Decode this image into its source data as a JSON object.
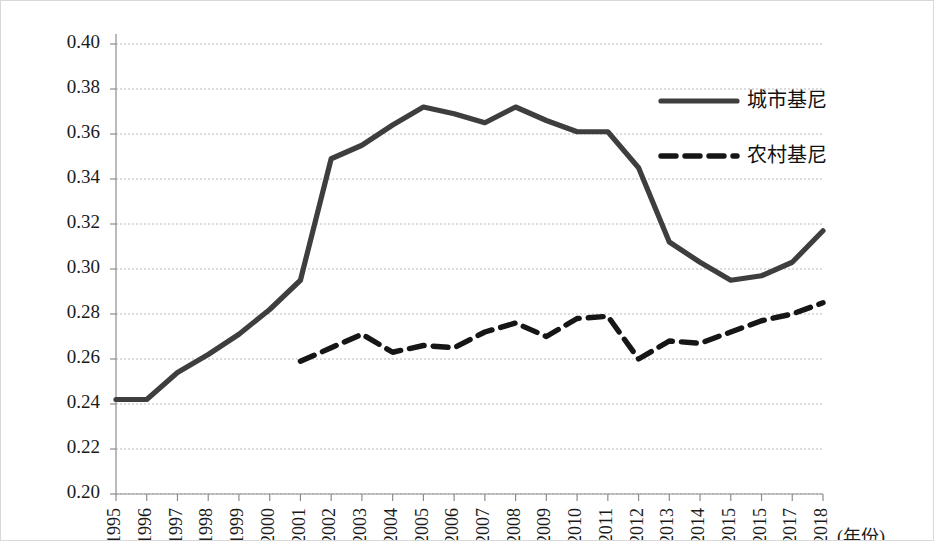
{
  "chart_data": {
    "type": "line",
    "title": "",
    "xlabel": "(年份)",
    "ylabel": "",
    "xlim": [
      1995,
      2018
    ],
    "ylim": [
      0.2,
      0.4
    ],
    "grid": true,
    "legend_position": "upper-right-inside",
    "x": [
      1995,
      1996,
      1997,
      1998,
      1999,
      2000,
      2001,
      2002,
      2003,
      2004,
      2005,
      2006,
      2007,
      2008,
      2009,
      2010,
      2011,
      2012,
      2013,
      2014,
      2015,
      2016,
      2017,
      2018
    ],
    "categories": [
      "1995",
      "1996",
      "1997",
      "1998",
      "1999",
      "2000",
      "2001",
      "2002",
      "2003",
      "2004",
      "2005",
      "2006",
      "2007",
      "2008",
      "2009",
      "2010",
      "2011",
      "2012",
      "2013",
      "2014",
      "2015",
      "2015",
      "2017",
      "2018"
    ],
    "ytick_labels": [
      "0.40",
      "0.38",
      "0.36",
      "0.34",
      "0.32",
      "0.30",
      "0.28",
      "0.26",
      "0.24",
      "0.22",
      "0.20"
    ],
    "ytick_values": [
      0.4,
      0.38,
      0.36,
      0.34,
      0.32,
      0.3,
      0.28,
      0.26,
      0.24,
      0.22,
      0.2
    ],
    "series": [
      {
        "name": "城市基尼",
        "style": "solid",
        "color": "#3e3e3e",
        "x": [
          1995,
          1996,
          1997,
          1998,
          1999,
          2000,
          2001,
          2002,
          2003,
          2004,
          2005,
          2006,
          2007,
          2008,
          2009,
          2010,
          2011,
          2012,
          2013,
          2014,
          2015,
          2016,
          2017,
          2018
        ],
        "values": [
          0.242,
          0.242,
          0.254,
          0.262,
          0.271,
          0.282,
          0.295,
          0.349,
          0.355,
          0.364,
          0.372,
          0.369,
          0.365,
          0.372,
          0.366,
          0.361,
          0.361,
          0.345,
          0.312,
          0.303,
          0.295,
          0.297,
          0.303,
          0.317
        ]
      },
      {
        "name": "农村基尼",
        "style": "dashed",
        "color": "#161616",
        "x": [
          2001,
          2002,
          2003,
          2004,
          2005,
          2006,
          2007,
          2008,
          2009,
          2010,
          2011,
          2012,
          2013,
          2014,
          2015,
          2016,
          2017,
          2018
        ],
        "values": [
          0.259,
          0.265,
          0.271,
          0.263,
          0.266,
          0.265,
          0.272,
          0.276,
          0.27,
          0.278,
          0.279,
          0.26,
          0.268,
          0.267,
          0.272,
          0.277,
          0.28,
          0.285
        ]
      }
    ]
  },
  "legend": {
    "entries": [
      {
        "label": "城市基尼",
        "style": "solid"
      },
      {
        "label": "农村基尼",
        "style": "dashed"
      }
    ]
  },
  "axis": {
    "x_unit_label": "(年份)"
  }
}
